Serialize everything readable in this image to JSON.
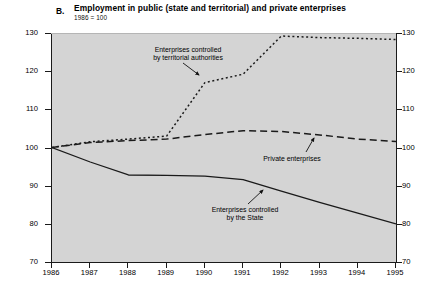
{
  "chart_data": {
    "type": "line",
    "title": "Employment in public (state and territorial) and private enterprises",
    "panel_letter": "B.",
    "subtitle": "1986 = 100",
    "xlabel": "",
    "ylabel": "",
    "xlim": [
      1986,
      1995
    ],
    "ylim": [
      70,
      130
    ],
    "grid": false,
    "legend_position": "inline-annotations",
    "x": [
      1986,
      1987,
      1988,
      1989,
      1990,
      1991,
      1992,
      1993,
      1994,
      1995
    ],
    "xticklabels": [
      "1986",
      "1987",
      "1988",
      "1989",
      "1990",
      "1991",
      "1992",
      "1993",
      "1994",
      "1995"
    ],
    "yticks": [
      70,
      80,
      90,
      100,
      110,
      120,
      130
    ],
    "yticklabels": [
      "70",
      "80",
      "90",
      "100",
      "110",
      "120",
      "130"
    ],
    "series": [
      {
        "name": "Enterprises controlled by territorial authorities",
        "style": "dotted",
        "color": "#1a1a1a",
        "values": [
          100.0,
          101.5,
          102.2,
          103.0,
          117.0,
          119.2,
          129.2,
          128.8,
          128.6,
          128.3
        ]
      },
      {
        "name": "Private enterprises",
        "style": "dashed",
        "color": "#1a1a1a",
        "values": [
          100.0,
          101.3,
          101.8,
          102.2,
          103.4,
          104.4,
          104.2,
          103.3,
          102.2,
          101.6
        ]
      },
      {
        "name": "Enterprises controlled by the State",
        "style": "solid",
        "color": "#1a1a1a",
        "values": [
          100.0,
          96.2,
          92.8,
          92.7,
          92.5,
          91.6,
          88.6,
          85.6,
          82.8,
          80.0
        ]
      }
    ],
    "annotations": [
      {
        "name": "territorial-authorities",
        "lines": [
          "Enterprises controlled",
          "by territorial authorities"
        ],
        "text_x": 188,
        "text_y": 46,
        "arrow_from": [
          182,
          63
        ],
        "arrow_to": [
          198,
          75
        ]
      },
      {
        "name": "private-enterprises",
        "lines": [
          "Private enterprises"
        ],
        "text_x": 292,
        "text_y": 155,
        "arrow_from": [
          305,
          152
        ],
        "arrow_to": [
          313,
          138
        ]
      },
      {
        "name": "state-enterprises",
        "lines": [
          "Enterprises controlled",
          "by the State"
        ],
        "text_x": 245,
        "text_y": 206,
        "arrow_from": [
          247,
          204
        ],
        "arrow_to": [
          262,
          190
        ]
      }
    ]
  },
  "colors": {
    "plot_background": "#d4d4d4",
    "page_background": "#ffffff",
    "axis": "#1a1a1a",
    "line": "#1a1a1a"
  }
}
